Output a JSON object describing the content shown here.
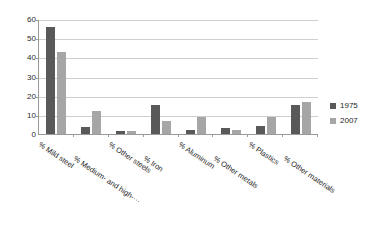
{
  "chart_data": {
    "type": "bar",
    "title": "",
    "subtitle": "",
    "xlabel": "",
    "ylabel": "",
    "ylim": [
      0,
      60
    ],
    "yticks": [
      0,
      10,
      20,
      30,
      40,
      50,
      60
    ],
    "ytick_labels": [
      "0",
      "10",
      "20",
      "30",
      "40",
      "50",
      "60"
    ],
    "grid": true,
    "legend_position": "right",
    "categories": [
      "% Mild steel",
      "% Medium- and high-···",
      "% Other steels",
      "% Iron",
      "% Aluminum",
      "% Other metals",
      "% Plastics",
      "% Other materials"
    ],
    "series": [
      {
        "name": "1975",
        "color": "#595959",
        "values": [
          56,
          3.5,
          1.5,
          15,
          2,
          3,
          4,
          15
        ]
      },
      {
        "name": "2007",
        "color": "#a6a6a6",
        "values": [
          43,
          12,
          1.7,
          7,
          9,
          2.3,
          9,
          16.5
        ]
      }
    ]
  },
  "legend": {
    "items": [
      {
        "label": "1975",
        "color": "#595959"
      },
      {
        "label": "2007",
        "color": "#a6a6a6"
      }
    ]
  },
  "axes": {
    "y_tick_labels": [
      "60",
      "50",
      "40",
      "30",
      "20",
      "10",
      "0"
    ]
  }
}
